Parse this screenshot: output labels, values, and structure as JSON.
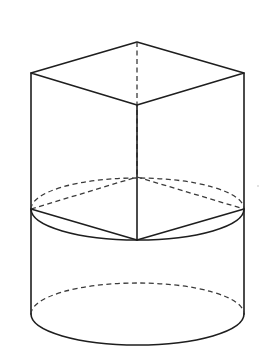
{
  "figure": {
    "colors": {
      "line": "#1e1e1e",
      "hidden_line": "#3a3a3a",
      "background": "#ffffff"
    },
    "cube": {
      "top_face": {
        "back": [
          137,
          42
        ],
        "left": [
          31,
          73
        ],
        "right": [
          244,
          73
        ],
        "front": [
          137,
          105
        ]
      },
      "bottom_face": {
        "back": [
          137,
          177
        ],
        "left": [
          31,
          209
        ],
        "right": [
          244,
          209
        ],
        "front": [
          137,
          240
        ]
      },
      "hidden_edges": [
        "top-back to bottom-back (vertical)",
        "bottom-left to bottom-back",
        "bottom-back to bottom-right"
      ]
    },
    "cylinder": {
      "left_x": 31,
      "right_x": 244,
      "middle_ellipse": {
        "cx": 137.5,
        "cy": 209,
        "rx": 106.5,
        "ry": 31
      },
      "bottom_ellipse": {
        "cx": 137.5,
        "cy": 314,
        "rx": 106.5,
        "ry": 31
      },
      "hidden_parts": [
        "back half of middle ellipse",
        "back half of bottom ellipse"
      ]
    },
    "labels": []
  }
}
